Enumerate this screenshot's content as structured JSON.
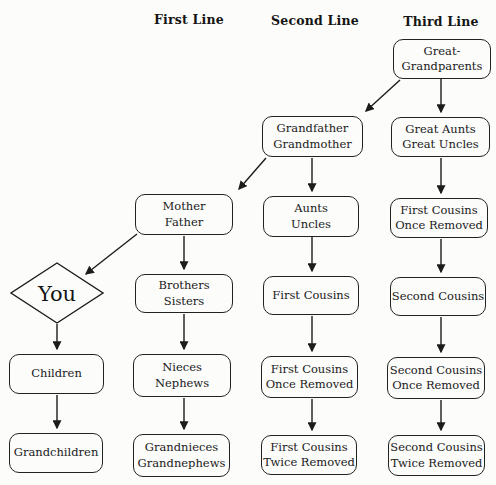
{
  "diagram_title": "Family relationship lines flowchart",
  "headers": {
    "first": "First Line",
    "second": "Second Line",
    "third": "Third Line"
  },
  "nodes": {
    "great_grandparents": {
      "lines": [
        "Great-",
        "Grandparents"
      ]
    },
    "grandfather_grandmother": {
      "lines": [
        "Grandfather",
        "Grandmother"
      ]
    },
    "great_aunts_uncles": {
      "lines": [
        "Great Aunts",
        "Great Uncles"
      ]
    },
    "mother_father": {
      "lines": [
        "Mother",
        "Father"
      ]
    },
    "aunts_uncles": {
      "lines": [
        "Aunts",
        "Uncles"
      ]
    },
    "first_cousins_once_removed_up": {
      "lines": [
        "First Cousins",
        "Once Removed"
      ]
    },
    "you": {
      "label": "You"
    },
    "brothers_sisters": {
      "lines": [
        "Brothers",
        "Sisters"
      ]
    },
    "first_cousins": {
      "lines": [
        "First Cousins"
      ]
    },
    "second_cousins": {
      "lines": [
        "Second Cousins"
      ]
    },
    "children": {
      "lines": [
        "Children"
      ]
    },
    "nieces_nephews": {
      "lines": [
        "Nieces",
        "Nephews"
      ]
    },
    "first_cousins_once_removed_down": {
      "lines": [
        "First Cousins",
        "Once Removed"
      ]
    },
    "second_cousins_once_removed": {
      "lines": [
        "Second Cousins",
        "Once Removed"
      ]
    },
    "grandchildren": {
      "lines": [
        "Grandchildren"
      ]
    },
    "grandnieces_grandnephews": {
      "lines": [
        "Grandnieces",
        "Grandnephews"
      ]
    },
    "first_cousins_twice_removed": {
      "lines": [
        "First Cousins",
        "Twice Removed"
      ]
    },
    "second_cousins_twice_removed": {
      "lines": [
        "Second Cousins",
        "Twice Removed"
      ]
    }
  },
  "edges": [
    {
      "from": "great_grandparents",
      "to": "grandfather_grandmother",
      "style": "diagonal"
    },
    {
      "from": "great_grandparents",
      "to": "great_aunts_uncles",
      "style": "vertical"
    },
    {
      "from": "grandfather_grandmother",
      "to": "mother_father",
      "style": "diagonal"
    },
    {
      "from": "grandfather_grandmother",
      "to": "aunts_uncles",
      "style": "vertical"
    },
    {
      "from": "great_aunts_uncles",
      "to": "first_cousins_once_removed_up",
      "style": "vertical"
    },
    {
      "from": "mother_father",
      "to": "you",
      "style": "diagonal"
    },
    {
      "from": "mother_father",
      "to": "brothers_sisters",
      "style": "vertical"
    },
    {
      "from": "aunts_uncles",
      "to": "first_cousins",
      "style": "vertical"
    },
    {
      "from": "first_cousins_once_removed_up",
      "to": "second_cousins",
      "style": "vertical"
    },
    {
      "from": "you",
      "to": "children",
      "style": "vertical"
    },
    {
      "from": "brothers_sisters",
      "to": "nieces_nephews",
      "style": "vertical"
    },
    {
      "from": "first_cousins",
      "to": "first_cousins_once_removed_down",
      "style": "vertical"
    },
    {
      "from": "second_cousins",
      "to": "second_cousins_once_removed",
      "style": "vertical"
    },
    {
      "from": "children",
      "to": "grandchildren",
      "style": "vertical"
    },
    {
      "from": "nieces_nephews",
      "to": "grandnieces_grandnephews",
      "style": "vertical"
    },
    {
      "from": "first_cousins_once_removed_down",
      "to": "first_cousins_twice_removed",
      "style": "vertical"
    },
    {
      "from": "second_cousins_once_removed",
      "to": "second_cousins_twice_removed",
      "style": "vertical"
    }
  ],
  "colors": {
    "background": "#fcfcfa",
    "line": "#1c1c1c",
    "box_border": "#222222",
    "text": "#1a1a1a"
  }
}
